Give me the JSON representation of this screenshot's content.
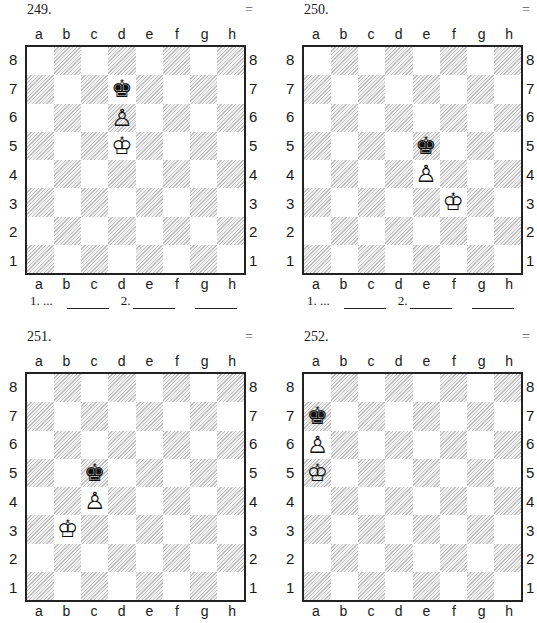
{
  "diagrams": [
    {
      "number": "249.",
      "evaluation": "=",
      "position": [
        {
          "square": "d7",
          "piece": "black-king",
          "glyph": "♚"
        },
        {
          "square": "d6",
          "piece": "white-pawn",
          "glyph": "♙"
        },
        {
          "square": "d5",
          "piece": "white-king",
          "glyph": "♔"
        }
      ],
      "moves": {
        "first": "1. ...",
        "second": "2."
      }
    },
    {
      "number": "250.",
      "evaluation": "=",
      "position": [
        {
          "square": "e5",
          "piece": "black-king",
          "glyph": "♚"
        },
        {
          "square": "e4",
          "piece": "white-pawn",
          "glyph": "♙"
        },
        {
          "square": "f3",
          "piece": "white-king",
          "glyph": "♔"
        }
      ],
      "moves": {
        "first": "1. ...",
        "second": "2."
      }
    },
    {
      "number": "251.",
      "evaluation": "=",
      "position": [
        {
          "square": "c5",
          "piece": "black-king",
          "glyph": "♚"
        },
        {
          "square": "c4",
          "piece": "white-pawn",
          "glyph": "♙"
        },
        {
          "square": "b3",
          "piece": "white-king",
          "glyph": "♔"
        }
      ]
    },
    {
      "number": "252.",
      "evaluation": "=",
      "position": [
        {
          "square": "a7",
          "piece": "black-king",
          "glyph": "♚"
        },
        {
          "square": "a6",
          "piece": "white-pawn",
          "glyph": "♙"
        },
        {
          "square": "a5",
          "piece": "white-king",
          "glyph": "♔"
        }
      ]
    }
  ],
  "board": {
    "files": [
      "a",
      "b",
      "c",
      "d",
      "e",
      "f",
      "g",
      "h"
    ],
    "ranks": [
      "8",
      "7",
      "6",
      "5",
      "4",
      "3",
      "2",
      "1"
    ],
    "colors": {
      "light": "#ffffff",
      "dark_hatch": "#bdbdbd",
      "border": "#222222"
    }
  }
}
